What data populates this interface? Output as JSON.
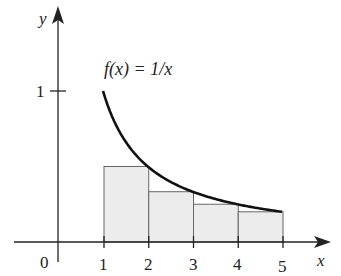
{
  "figure": {
    "function_label": "f(x) = 1/x",
    "x_axis_label": "x",
    "y_axis_label": "y",
    "origin_label": "0",
    "y_tick_label": "1",
    "x_tick_labels": [
      "1",
      "2",
      "3",
      "4",
      "5"
    ]
  },
  "chart_data": {
    "type": "area",
    "title": "f(x) = 1/x",
    "xlabel": "x",
    "ylabel": "y",
    "curve": {
      "function": "1/x",
      "x_range": [
        1,
        5
      ]
    },
    "rectangles": [
      {
        "x0": 1,
        "x1": 2,
        "height": 0.5
      },
      {
        "x0": 2,
        "x1": 3,
        "height": 0.3333
      },
      {
        "x0": 3,
        "x1": 4,
        "height": 0.25
      },
      {
        "x0": 4,
        "x1": 5,
        "height": 0.2
      }
    ],
    "x_ticks": [
      1,
      2,
      3,
      4,
      5
    ],
    "y_ticks": [
      1
    ],
    "grid": false,
    "colors": {
      "rect_fill": "#ececec",
      "rect_stroke": "#666666",
      "curve": "#111111",
      "axes": "#222222"
    }
  }
}
